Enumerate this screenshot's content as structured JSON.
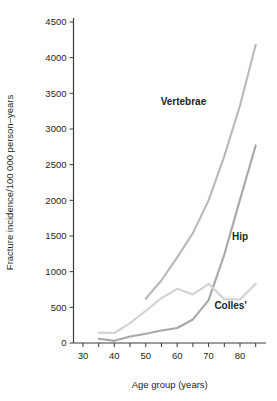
{
  "chart_data": {
    "type": "line",
    "title": "",
    "xlabel": "Age group (years)",
    "ylabel": "Fracture incidence/100 000 person–years",
    "xlim": [
      27,
      87
    ],
    "ylim": [
      0,
      4500
    ],
    "xticks": [
      30,
      40,
      50,
      60,
      70,
      80
    ],
    "xtick_labels": [
      "30",
      "40",
      "50",
      "60",
      "70",
      "80"
    ],
    "xminor_ticks": [
      30,
      35,
      40,
      45,
      50,
      55,
      60,
      65,
      70,
      75,
      80,
      85
    ],
    "yticks": [
      0,
      500,
      1000,
      1500,
      2000,
      2500,
      3000,
      3500,
      4000,
      4500
    ],
    "ytick_labels": [
      "0",
      "500",
      "1000",
      "1500",
      "2000",
      "2500",
      "3000",
      "3500",
      "4000",
      "4500"
    ],
    "grid": false,
    "legend_position": "inline-annotations",
    "series": [
      {
        "name": "Vertebrae",
        "color": "#b9b9b9",
        "label_x": 62,
        "label_y": 3330,
        "x": [
          50,
          55,
          60,
          65,
          70,
          75,
          80,
          85
        ],
        "values": [
          620,
          880,
          1200,
          1540,
          2000,
          2620,
          3330,
          4180
        ]
      },
      {
        "name": "Hip",
        "color": "#a8a8a8",
        "label_x": 80,
        "label_y": 1450,
        "x": [
          35,
          40,
          45,
          50,
          55,
          60,
          65,
          70,
          75,
          80,
          85
        ],
        "values": [
          60,
          30,
          90,
          130,
          175,
          210,
          330,
          600,
          1240,
          2010,
          2770
        ]
      },
      {
        "name": "Colles'",
        "color": "#d2d2d2",
        "label_x": 77,
        "label_y": 470,
        "x": [
          35,
          40,
          45,
          50,
          55,
          60,
          65,
          70,
          75,
          80,
          85
        ],
        "values": [
          145,
          140,
          280,
          450,
          630,
          760,
          680,
          830,
          615,
          610,
          830
        ]
      }
    ]
  }
}
